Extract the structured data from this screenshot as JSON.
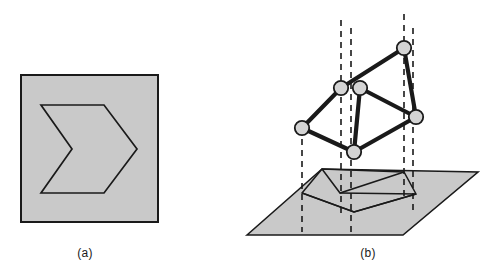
{
  "figure": {
    "background_color": "#ffffff",
    "stroke_color": "#1a1a1a",
    "fill_gray": "#c9c9c9",
    "node_fill": "#d4d4d4",
    "panels": [
      {
        "id": "a",
        "caption": "(a)",
        "description": "2D line drawing of a chevron / arrow-like hexagon inside a gray square frame",
        "square": {
          "x": 21,
          "y": 75,
          "width": 137,
          "height": 147
        },
        "polygon_points": "41,105 104,105 137,149 104,193 41,193 72,149"
      },
      {
        "id": "b",
        "caption": "(b)",
        "description": "3D interpretation: a skew hexagonal wireframe with spherical joints floating above a gray ground plane, with dashed vertical projection lines onto its shadow",
        "ground_plane_points": "247,235 322,169 478,172 403,235",
        "projection_polygon": "302,193 322,169 404,172 416,194 354,212",
        "projection_inner_points": "302,193 354,212 416,194",
        "wireframe_vertices": [
          {
            "name": "v-left",
            "x": 302,
            "y": 128
          },
          {
            "name": "v-upper-left",
            "x": 341,
            "y": 88
          },
          {
            "name": "v-upper-mid",
            "x": 360,
            "y": 88
          },
          {
            "name": "v-top-right",
            "x": 404,
            "y": 48
          },
          {
            "name": "v-right",
            "x": 416,
            "y": 117
          },
          {
            "name": "v-bottom",
            "x": 354,
            "y": 152
          }
        ],
        "wireframe_edges": [
          [
            "v-left",
            "v-upper-left"
          ],
          [
            "v-upper-left",
            "v-top-right"
          ],
          [
            "v-top-right",
            "v-right"
          ],
          [
            "v-right",
            "v-bottom"
          ],
          [
            "v-bottom",
            "v-left"
          ],
          [
            "v-upper-mid",
            "v-right"
          ],
          [
            "v-upper-mid",
            "v-bottom"
          ]
        ],
        "dashed_projection_lines": [
          {
            "name": "drop-left",
            "x1": 302,
            "y1": 128,
            "x2": 302,
            "y2": 232
          },
          {
            "name": "drop-upper-left",
            "x1": 341,
            "y1": 20,
            "x2": 341,
            "y2": 214
          },
          {
            "name": "drop-upper-mid",
            "x1": 351,
            "y1": 28,
            "x2": 351,
            "y2": 232
          },
          {
            "name": "drop-top-right",
            "x1": 404,
            "y1": 14,
            "x2": 404,
            "y2": 200
          },
          {
            "name": "drop-right",
            "x1": 413,
            "y1": 28,
            "x2": 413,
            "y2": 214
          }
        ]
      }
    ]
  }
}
